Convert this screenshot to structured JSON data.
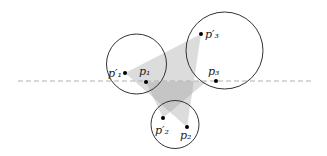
{
  "diagram": {
    "dashed_line": {
      "y": 81,
      "x1": 18,
      "x2": 313,
      "color": "#b8b8b8"
    },
    "circles": [
      {
        "id": "c1",
        "cx": 136.5,
        "cy": 64,
        "r": 30
      },
      {
        "id": "c2",
        "cx": 175,
        "cy": 124.5,
        "r": 24
      },
      {
        "id": "c3",
        "cx": 224.5,
        "cy": 50.5,
        "r": 38.5
      }
    ],
    "points": [
      {
        "id": "p1_prime",
        "x": 125,
        "y": 73,
        "label": "p",
        "sub": "1",
        "prime": true
      },
      {
        "id": "p1",
        "x": 146,
        "y": 82,
        "label": "p",
        "sub": "1",
        "prime": false
      },
      {
        "id": "p2_prime",
        "x": 163,
        "y": 118,
        "label": "p",
        "sub": "2",
        "prime": true
      },
      {
        "id": "p2",
        "x": 187,
        "y": 127,
        "label": "p",
        "sub": "2",
        "prime": false
      },
      {
        "id": "p3_prime",
        "x": 201,
        "y": 34,
        "label": "p",
        "sub": "3",
        "prime": true
      },
      {
        "id": "p3",
        "x": 216,
        "y": 81,
        "label": "p",
        "sub": "3",
        "prime": false
      }
    ],
    "triangles": [
      {
        "id": "t_prime",
        "vertices": [
          "p1_prime",
          "p3_prime",
          "p2"
        ],
        "fill": "#d9d9d9"
      },
      {
        "id": "t_orig",
        "vertices": [
          "p1",
          "p3",
          "p2_prime"
        ],
        "fill": "#d9d9d9"
      }
    ],
    "labels": {
      "p1_prime": "p′₁",
      "p1": "p₁",
      "p2_prime": "p′₂",
      "p2": "p₂",
      "p3_prime": "p′₃",
      "p3": "p₃"
    }
  }
}
